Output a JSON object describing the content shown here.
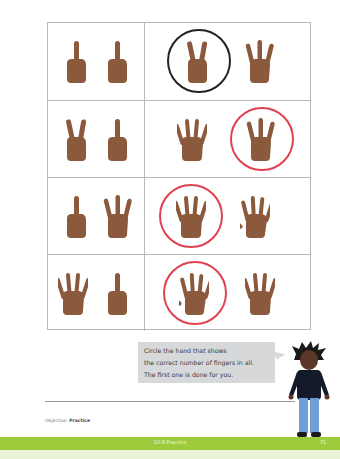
{
  "worksheet": {
    "colors": {
      "skin": "#8b5a3c",
      "grid_line": "#b8b8b8",
      "example_circle": "#222222",
      "answer_circle": "#e0414f",
      "footer_green": "#9ccc3c",
      "speech_bg": "#d6d8da"
    },
    "rows": [
      {
        "addends": [
          1,
          1
        ],
        "choices": [
          2,
          3
        ],
        "circled_index": 0,
        "circle_style": "example"
      },
      {
        "addends": [
          2,
          1
        ],
        "choices": [
          4,
          3
        ],
        "circled_index": 1,
        "circle_style": "answer"
      },
      {
        "addends": [
          1,
          3
        ],
        "choices": [
          4,
          5
        ],
        "circled_index": 0,
        "circle_style": "answer"
      },
      {
        "addends": [
          4,
          1
        ],
        "choices": [
          5,
          4
        ],
        "circled_index": 0,
        "circle_style": "answer"
      }
    ],
    "instructions": {
      "line1": "Circle the hand that shows",
      "line2": "the correct number of fingers in all.",
      "line3": "The first one is done for you."
    },
    "objective_label": "Objective:",
    "objective_value": "Practice",
    "footer_title": "10-8 Practice",
    "page_number": "71"
  }
}
